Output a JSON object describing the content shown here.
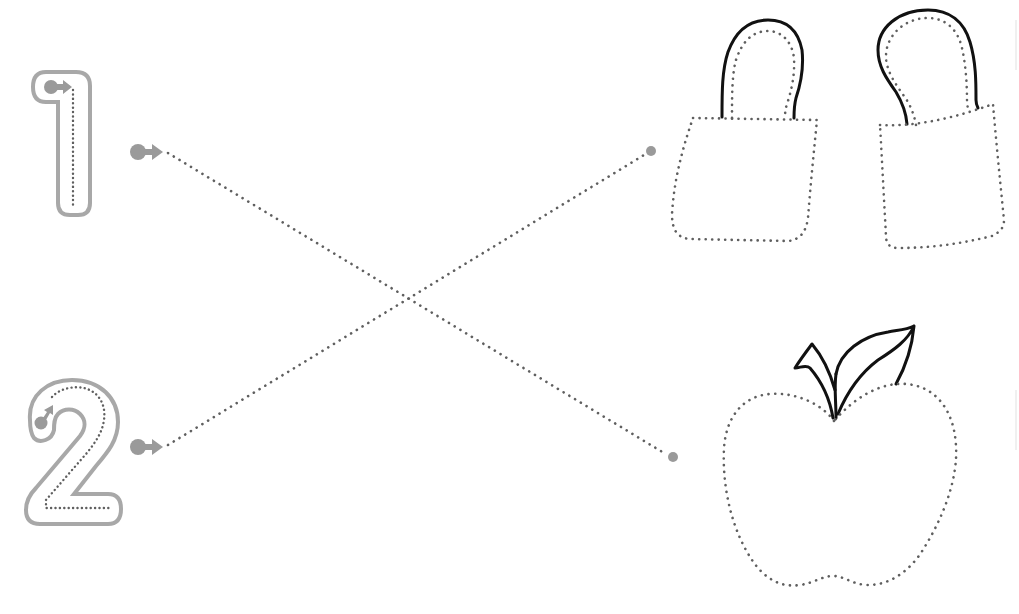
{
  "worksheet": {
    "activity": "trace-and-match",
    "colors": {
      "background": "#ffffff",
      "number_outline": "#a8a8a8",
      "start_dot": "#9a9a9a",
      "dotted_line": "#5f5f5f",
      "solid_stroke": "#111111"
    },
    "numbers": [
      {
        "label": "1",
        "value": 1
      },
      {
        "label": "2",
        "value": 2
      }
    ],
    "pictures": [
      {
        "label": "two bags",
        "count": 2,
        "icon": "shopping-bag-icon"
      },
      {
        "label": "one apple",
        "count": 1,
        "icon": "apple-icon"
      }
    ],
    "connections": [
      {
        "from": "1",
        "to": "one apple"
      },
      {
        "from": "2",
        "to": "two bags"
      }
    ]
  }
}
